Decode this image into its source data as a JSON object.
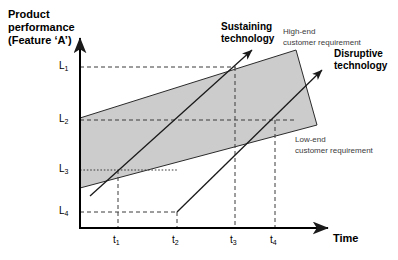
{
  "figure": {
    "type": "diagram",
    "background_color": "#ffffff",
    "band_fill_color": "#cccccc",
    "line_color": "#1a1a1a",
    "text_color": "#000000",
    "secondary_text_color": "#3b3b3b"
  },
  "axes": {
    "y_title_line1": "Product",
    "y_title_line2": "performance",
    "y_title_line3": "(Feature ‘A’)",
    "x_title": "Time",
    "y_ticks": [
      {
        "label": "L",
        "sub": "1"
      },
      {
        "label": "L",
        "sub": "2"
      },
      {
        "label": "L",
        "sub": "3"
      },
      {
        "label": "L",
        "sub": "4"
      }
    ],
    "x_ticks": [
      {
        "label": "t",
        "sub": "1"
      },
      {
        "label": "t",
        "sub": "2"
      },
      {
        "label": "t",
        "sub": "3"
      },
      {
        "label": "t",
        "sub": "4"
      }
    ]
  },
  "annotations": {
    "sustaining_line1": "Sustaining",
    "sustaining_line2": "technology",
    "disruptive_line1": "Disruptive",
    "disruptive_line2": "technology",
    "high_end_line1": "High-end",
    "high_end_line2": "customer requirement",
    "low_end_line1": "Low-end",
    "low_end_line2": "customer requirement"
  }
}
